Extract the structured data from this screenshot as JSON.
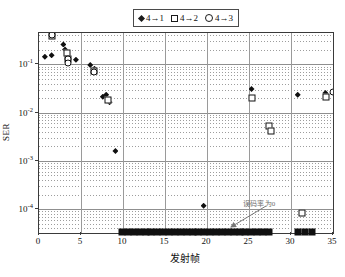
{
  "chart_data": {
    "type": "scatter",
    "title": "",
    "xlabel": "发射帧",
    "ylabel": "SER",
    "xlim": [
      0,
      35
    ],
    "ylim": [
      3.2e-05,
      0.45
    ],
    "yscale": "log",
    "grid": true,
    "legend_position": "top-center",
    "xticks": [
      0,
      5,
      10,
      15,
      20,
      25,
      30,
      35
    ],
    "xtick_labels": [
      "0",
      "5",
      "10",
      "15",
      "20",
      "25",
      "30",
      "35"
    ],
    "yticks": [
      0.1,
      0.01,
      0.001,
      0.0001
    ],
    "ytick_labels": [
      "10-1",
      "10-2",
      "10-3",
      "10-4"
    ],
    "annotations": [
      {
        "text": "误码率为0",
        "x": 23.5,
        "y": 0.00016,
        "points_to_x": 17.5,
        "points_to_y": 3.3e-05
      }
    ],
    "series": [
      {
        "name": "4→1",
        "marker": "filled-diamond",
        "color": "#101010",
        "points": [
          {
            "x": 0.7,
            "y": 0.145
          },
          {
            "x": 1.5,
            "y": 0.155
          },
          {
            "x": 2.9,
            "y": 0.26
          },
          {
            "x": 3.1,
            "y": 0.205
          },
          {
            "x": 4.4,
            "y": 0.125
          },
          {
            "x": 6.1,
            "y": 0.098
          },
          {
            "x": 6.6,
            "y": 0.082
          },
          {
            "x": 7.6,
            "y": 0.0215
          },
          {
            "x": 8.0,
            "y": 0.0235
          },
          {
            "x": 8.4,
            "y": 0.0165
          },
          {
            "x": 9.1,
            "y": 0.0016
          },
          {
            "x": 19.6,
            "y": 0.000118
          },
          {
            "x": 25.3,
            "y": 0.031
          },
          {
            "x": 30.8,
            "y": 0.0235
          },
          {
            "x": 34.1,
            "y": 0.0255
          },
          {
            "x": 35.0,
            "y": 0.0265
          }
        ]
      },
      {
        "name": "4→2",
        "marker": "open-square",
        "color": "#101010",
        "points": [
          {
            "x": 1.6,
            "y": 0.395
          },
          {
            "x": 3.3,
            "y": 0.175
          },
          {
            "x": 3.4,
            "y": 0.128
          },
          {
            "x": 6.5,
            "y": 0.072
          },
          {
            "x": 8.2,
            "y": 0.0185
          },
          {
            "x": 25.4,
            "y": 0.0205
          },
          {
            "x": 27.4,
            "y": 0.0052
          },
          {
            "x": 27.6,
            "y": 0.0042
          },
          {
            "x": 31.3,
            "y": 8.2e-05
          },
          {
            "x": 34.2,
            "y": 0.0215
          }
        ]
      },
      {
        "name": "4→3",
        "marker": "open-circle",
        "color": "#101010",
        "points": [
          {
            "x": 1.5,
            "y": 0.405
          },
          {
            "x": 3.4,
            "y": 0.132
          },
          {
            "x": 3.5,
            "y": 0.108
          },
          {
            "x": 6.6,
            "y": 0.07
          },
          {
            "x": 35.0,
            "y": 0.0265
          }
        ]
      }
    ],
    "zero_ser_markers": {
      "note": "filled square markers drawn on the x-axis baseline indicating SER = 0",
      "y": 0,
      "x_values": [
        10,
        10.7,
        11.4,
        12.1,
        12.8,
        13.5,
        14.2,
        14.9,
        15.6,
        16.3,
        17.0,
        17.7,
        18.4,
        19.1,
        19.8,
        20.5,
        21.2,
        21.9,
        22.6,
        23.3,
        24.0,
        24.7,
        25.4,
        26.1,
        26.8,
        27.5,
        31.0,
        31.8,
        32.6
      ]
    }
  },
  "legend": {
    "items": [
      {
        "label": "4→1",
        "marker": "filled-diamond"
      },
      {
        "label": "4→2",
        "marker": "open-square"
      },
      {
        "label": "4→3",
        "marker": "open-circle"
      }
    ]
  }
}
